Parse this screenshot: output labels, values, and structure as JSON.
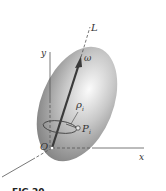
{
  "diagram": {
    "labels": {
      "axis_L": "L",
      "omega": "ω",
      "axis_y": "y",
      "axis_x": "x",
      "origin": "O",
      "rho": "ρ",
      "rho_sub": "i",
      "point": "P",
      "point_sub": "i",
      "caption": "FIG 20"
    },
    "colors": {
      "body_light": "#f4f4f4",
      "body_dark": "#8a8a8a",
      "axis_line": "#555555",
      "arrow": "#3a3a3a"
    }
  }
}
